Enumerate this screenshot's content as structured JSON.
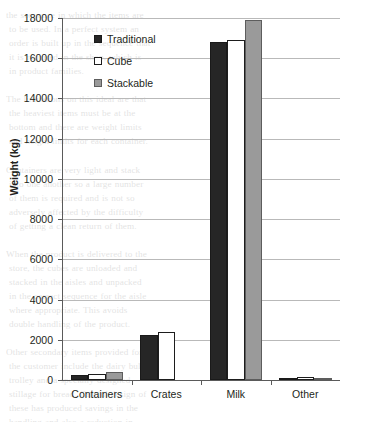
{
  "chart_data": {
    "type": "bar",
    "title": "",
    "subtitle": "",
    "xlabel": "",
    "ylabel": "Weight (kg)",
    "categories": [
      "Containers",
      "Crates",
      "Milk",
      "Other"
    ],
    "series": [
      {
        "name": "Traditional",
        "color": "#262626",
        "values": [
          250,
          2250,
          16800,
          90
        ]
      },
      {
        "name": "Cube",
        "color": "#ffffff",
        "values": [
          280,
          2400,
          16900,
          130
        ]
      },
      {
        "name": "Stackable",
        "color": "#9a9a9a",
        "values": [
          420,
          0,
          17900,
          70
        ]
      }
    ],
    "ylim": [
      0,
      18000
    ],
    "yticks": [
      0,
      2000,
      4000,
      6000,
      8000,
      10000,
      12000,
      14000,
      16000,
      18000
    ],
    "ytick_labels": [
      "0",
      "2000",
      "4000",
      "6000",
      "8000",
      "10000",
      "12000",
      "14000",
      "16000",
      "18000"
    ],
    "grid": "horizontal",
    "legend_position": "top-left-inside",
    "legend_entries": [
      "Traditional",
      "Cube",
      "Stackable"
    ]
  },
  "background_text": "the sequence in which the items are\n to be used. In a perfect system an\n order is built up in the sequence that\n it is required in the shop, which is\n in product families.\n\nThe limitations on this ideal are that\n the heaviest items must be at the\n bottom and there are weight limits\n and height limits for each container.\n\nContainers are very light and stack\n into one another so a large number\n of them is required and is not so\n adversely affected by the difficulty\n of getting a clean return of them.\n\nWhen the product is delivered to the\n store, the cubes are unloaded and\n stacked in the aisles and unpacked\n in the correct sequence for the aisle\n where appropriate. This avoids\n double handling of the product.\n\nOther secondary items provided for\n the customer include the dairy bulk\n trolley and a specially designed\n stillage for bread. Careful design of\n these has produced savings in the\n handling and also a reduction in\n damaged product. A summary of the\n weight carried in each of the types\n of container is shown in the figure."
}
